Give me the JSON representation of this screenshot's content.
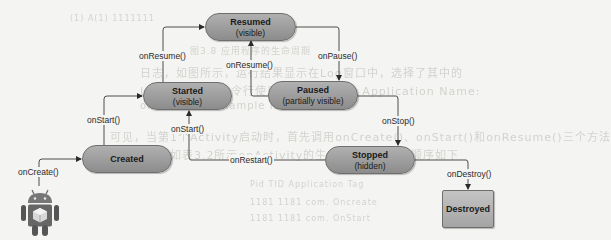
{
  "diagram": {
    "states": {
      "resumed": {
        "name": "Resumed",
        "sub": "(visible)"
      },
      "started": {
        "name": "Started",
        "sub": "(visible)"
      },
      "paused": {
        "name": "Paused",
        "sub": "(partially visible)"
      },
      "created": {
        "name": "Created",
        "sub": ""
      },
      "stopped": {
        "name": "Stopped",
        "sub": "(hidden)"
      },
      "destroyed": {
        "name": "Destroyed",
        "sub": ""
      }
    },
    "transitions": {
      "on_create": "onCreate()",
      "on_start_created": "onStart()",
      "on_start_restart": "onStart()",
      "on_resume_started": "onResume()",
      "on_resume_paused": "onResume()",
      "on_pause": "onPause()",
      "on_stop": "onStop()",
      "on_restart": "onRestart()",
      "on_destroy": "onDestroy()"
    },
    "start_icon": "android-robot-icon"
  },
  "colors": {
    "state_fill_top": "#b0b0b0",
    "state_fill_bottom": "#8c8c8c",
    "line": "#3a3a3a",
    "page_background": "#f4f4f2",
    "bleed_text": "#d2d2cf"
  },
  "background_bleed": {
    "line1": "(1)  A(1)        1111111",
    "line2": "图3.8   应用程序的生命周期",
    "line3": "日志，如图所示，运行结果显示在Log窗口中，选择了其中的",
    "line4": "Logcat，通过命令行使用 Tag 过滤：2. Application Name:",
    "line5": "on attribute example ID: 0.",
    "line6": "可见，当第1个Activity启动时，首先调用onCreate()、onStart()和onResume()三个方法",
    "line7": "。这个过程如表3.2所示onActivity的生命周期方法调用顺序如下",
    "line8": "Pid      TID     Application     Tag",
    "line9": "1181     1181    com.        Oncreate",
    "line10": "1181     1181    com.        OnStart"
  }
}
